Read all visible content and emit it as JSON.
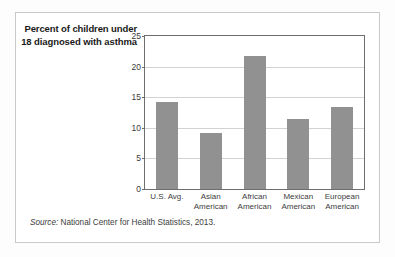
{
  "figure": {
    "title": "Percent of children under 18 diagnosed with asthma",
    "source_label": "Source:",
    "source_text": "National Center for Health Statistics, 2013."
  },
  "colors": {
    "bar_fill": "#919191",
    "axis": "#6e6e6e",
    "grid": "#d2d2d2",
    "frame": "#c9c9c9",
    "text": "#3d3d3d"
  },
  "chart_data": {
    "type": "bar",
    "title": "Percent of children under 18 diagnosed with asthma",
    "xlabel": "",
    "ylabel": "Percent of children under 18 diagnosed with asthma",
    "ylim": [
      0,
      25
    ],
    "yticks": [
      0,
      5,
      10,
      15,
      20,
      25
    ],
    "ytick_labels": [
      "0",
      "5",
      "10",
      "15",
      "20",
      "25"
    ],
    "grid": true,
    "legend": "none",
    "categories": [
      "U.S. Avg.",
      "Asian American",
      "African American",
      "Mexican American",
      "European American"
    ],
    "category_labels": [
      "U.S. Avg.",
      "Asian\nAmerican",
      "African\nAmerican",
      "Mexican\nAmerican",
      "European\nAmerican"
    ],
    "values": [
      14.2,
      9.1,
      21.8,
      11.4,
      13.4
    ],
    "source": "Source: National Center for Health Statistics, 2013."
  }
}
